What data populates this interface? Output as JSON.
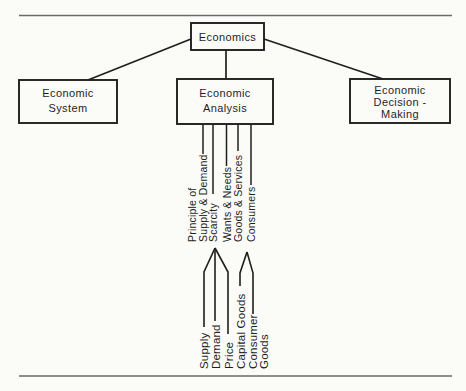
{
  "palette": {
    "background": "#fbfbf8",
    "ink": "#1f1f1f",
    "rule": "#6b6b6b"
  },
  "diagram": {
    "root": {
      "label": "Economics"
    },
    "branches": [
      {
        "name": "economic-system",
        "lines": [
          "Economic",
          "System"
        ]
      },
      {
        "name": "economic-analysis",
        "lines": [
          "Economic",
          "Analysis"
        ]
      },
      {
        "name": "economic-decision-making",
        "lines": [
          "Economic",
          "Decision -",
          "Making"
        ]
      }
    ],
    "analysis_topics": [
      {
        "text": "Principle of"
      },
      {
        "text": "Supply & Demand"
      },
      {
        "text": "Scarcity"
      },
      {
        "text": "Wants & Needs"
      },
      {
        "text": "Goods & Services"
      },
      {
        "text": "Consumers"
      }
    ],
    "influence_labels": [
      {
        "text": "Supply"
      },
      {
        "text": "Demand"
      },
      {
        "text": "Price"
      },
      {
        "text": "Capital Goods"
      },
      {
        "text": "Consumer"
      },
      {
        "text": "Goods"
      }
    ],
    "arrows": [
      {
        "sources": [
          "Supply",
          "Demand",
          "Price"
        ],
        "points_to": "Scarcity"
      },
      {
        "sources": [
          "Capital Goods",
          "Consumer Goods"
        ],
        "points_to": "Goods & Services"
      }
    ]
  }
}
